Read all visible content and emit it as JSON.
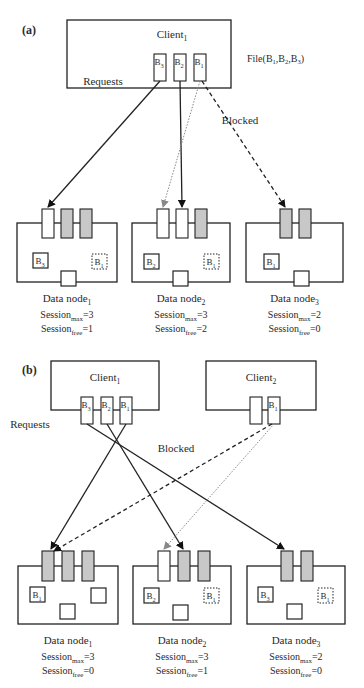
{
  "panels": [
    {
      "id": "a",
      "label": "(a)",
      "clients": [
        {
          "name": "Client",
          "sub": "1",
          "box": [
            67,
            20,
            164,
            68
          ],
          "name_pos": [
            172,
            38
          ],
          "slots": [
            {
              "x": 154,
              "label": "B",
              "sub": "3"
            },
            {
              "x": 174,
              "label": "B",
              "sub": "2"
            },
            {
              "x": 194,
              "label": "B",
              "sub": "1"
            }
          ],
          "slot_y": 54,
          "slot_w": 12,
          "slot_h": 27
        }
      ],
      "file_label": {
        "text": "File(B",
        "parts": [
          "1",
          ",B",
          "2",
          ",B",
          "3",
          ")"
        ],
        "pos": [
          247,
          62
        ]
      },
      "requests_label": {
        "text": "Requests",
        "pos": [
          103,
          85
        ]
      },
      "blocked_label": {
        "text": "Blocked",
        "pos": [
          240,
          124
        ]
      },
      "nodes": [
        {
          "name": "Data node",
          "sub": "1",
          "box": [
            17,
            223,
            100,
            59
          ],
          "slots": [
            {
              "x": 42,
              "fill": "#ffffff"
            },
            {
              "x": 61,
              "fill": "#c8c8c8"
            },
            {
              "x": 80,
              "fill": "#c8c8c8"
            }
          ],
          "slot_y": 209,
          "slot_w": 12,
          "slot_h": 29,
          "blocks": [
            {
              "x": 33,
              "y": 253,
              "label": "B",
              "sub": "3",
              "dotted": false
            },
            {
              "x": 92,
              "y": 254,
              "label": "B",
              "sub": "1",
              "dotted": true
            },
            {
              "x": 61,
              "y": 271,
              "label": "",
              "sub": "",
              "dotted": false
            }
          ],
          "session_max": "3",
          "session_free": "1"
        },
        {
          "name": "Data node",
          "sub": "2",
          "box": [
            132,
            223,
            98,
            59
          ],
          "slots": [
            {
              "x": 157,
              "fill": "#ffffff"
            },
            {
              "x": 176,
              "fill": "#ffffff"
            },
            {
              "x": 195,
              "fill": "#c8c8c8"
            }
          ],
          "slot_y": 209,
          "slot_w": 12,
          "slot_h": 29,
          "blocks": [
            {
              "x": 144,
              "y": 254,
              "label": "B",
              "sub": "2",
              "dotted": false
            },
            {
              "x": 204,
              "y": 254,
              "label": "B",
              "sub": "1",
              "dotted": true
            },
            {
              "x": 173,
              "y": 271,
              "label": "",
              "sub": "",
              "dotted": false
            }
          ],
          "session_max": "3",
          "session_free": "2"
        },
        {
          "name": "Data node",
          "sub": "3",
          "box": [
            246,
            223,
            97,
            59
          ],
          "slots": [
            {
              "x": 280,
              "fill": "#c8c8c8"
            },
            {
              "x": 299,
              "fill": "#c8c8c8"
            }
          ],
          "slot_y": 209,
          "slot_w": 12,
          "slot_h": 29,
          "blocks": [
            {
              "x": 264,
              "y": 254,
              "label": "B",
              "sub": "1",
              "dotted": false
            },
            {
              "x": 294,
              "y": 271,
              "label": "",
              "sub": "",
              "dotted": false
            }
          ],
          "session_max": "2",
          "session_free": "0"
        }
      ],
      "node_label_y": 302,
      "arrows": [
        {
          "from": [
            160,
            81
          ],
          "to": [
            48,
            207
          ],
          "style": "solid",
          "color": "#222222"
        },
        {
          "from": [
            180,
            81
          ],
          "to": [
            182,
            207
          ],
          "style": "solid",
          "color": "#222222"
        },
        {
          "from": [
            200,
            81
          ],
          "to": [
            163,
            207
          ],
          "style": "dotted",
          "color": "#888888"
        },
        {
          "from": [
            202,
            81
          ],
          "to": [
            285,
            207
          ],
          "style": "dashed",
          "color": "#222222"
        }
      ]
    },
    {
      "id": "b",
      "label": "(b)",
      "clients": [
        {
          "name": "Client",
          "sub": "1",
          "box": [
            51,
            361,
            108,
            49
          ],
          "name_pos": [
            105,
            381
          ],
          "slots": [
            {
              "x": 81,
              "label": "B",
              "sub": "3"
            },
            {
              "x": 101,
              "label": "B",
              "sub": "2"
            },
            {
              "x": 120,
              "label": "B",
              "sub": "1"
            }
          ],
          "slot_y": 397,
          "slot_w": 12,
          "slot_h": 27
        },
        {
          "name": "Client",
          "sub": "2",
          "box": [
            206,
            361,
            110,
            49
          ],
          "name_pos": [
            261,
            381
          ],
          "slots": [
            {
              "x": 250,
              "label": "",
              "sub": ""
            },
            {
              "x": 268,
              "label": "B",
              "sub": "1"
            }
          ],
          "slot_y": 397,
          "slot_w": 12,
          "slot_h": 27
        }
      ],
      "requests_label": {
        "text": "Requests",
        "pos": [
          30,
          428
        ]
      },
      "blocked_label": {
        "text": "Blocked",
        "pos": [
          176,
          452
        ]
      },
      "nodes": [
        {
          "name": "Data node",
          "sub": "1",
          "box": [
            18,
            566,
            100,
            58
          ],
          "slots": [
            {
              "x": 42,
              "fill": "#c8c8c8"
            },
            {
              "x": 62,
              "fill": "#c8c8c8"
            },
            {
              "x": 82,
              "fill": "#c8c8c8"
            }
          ],
          "slot_y": 551,
          "slot_w": 12,
          "slot_h": 30,
          "blocks": [
            {
              "x": 30,
              "y": 587,
              "label": "B",
              "sub": "1",
              "dotted": false
            },
            {
              "x": 91,
              "y": 588,
              "label": "",
              "sub": "",
              "dotted": false
            },
            {
              "x": 60,
              "y": 604,
              "label": "",
              "sub": "",
              "dotted": false
            }
          ],
          "session_max": "3",
          "session_free": "0"
        },
        {
          "name": "Data node",
          "sub": "2",
          "box": [
            133,
            566,
            98,
            58
          ],
          "slots": [
            {
              "x": 158,
              "fill": "#ffffff"
            },
            {
              "x": 178,
              "fill": "#c8c8c8"
            },
            {
              "x": 198,
              "fill": "#c8c8c8"
            }
          ],
          "slot_y": 551,
          "slot_w": 12,
          "slot_h": 30,
          "blocks": [
            {
              "x": 144,
              "y": 588,
              "label": "B",
              "sub": "2",
              "dotted": false
            },
            {
              "x": 204,
              "y": 588,
              "label": "B",
              "sub": "1",
              "dotted": true
            },
            {
              "x": 173,
              "y": 605,
              "label": "",
              "sub": "",
              "dotted": false
            }
          ],
          "session_max": "3",
          "session_free": "1"
        },
        {
          "name": "Data node",
          "sub": "3",
          "box": [
            247,
            566,
            98,
            58
          ],
          "slots": [
            {
              "x": 281,
              "fill": "#c8c8c8"
            },
            {
              "x": 301,
              "fill": "#c8c8c8"
            }
          ],
          "slot_y": 551,
          "slot_w": 12,
          "slot_h": 30,
          "blocks": [
            {
              "x": 258,
              "y": 587,
              "label": "B",
              "sub": "3",
              "dotted": false
            },
            {
              "x": 318,
              "y": 588,
              "label": "B",
              "sub": "1",
              "dotted": true
            },
            {
              "x": 287,
              "y": 604,
              "label": "",
              "sub": "",
              "dotted": false
            }
          ],
          "session_max": "2",
          "session_free": "0"
        }
      ],
      "node_label_y": 644,
      "arrows": [
        {
          "from": [
            126,
            424
          ],
          "to": [
            51,
            549
          ],
          "style": "solid",
          "color": "#222222"
        },
        {
          "from": [
            107,
            424
          ],
          "to": [
            183,
            549
          ],
          "style": "solid",
          "color": "#222222"
        },
        {
          "from": [
            87,
            424
          ],
          "to": [
            284,
            549
          ],
          "style": "solid",
          "color": "#222222"
        },
        {
          "from": [
            272,
            424
          ],
          "to": [
            54,
            551
          ],
          "style": "dashed",
          "color": "#222222"
        },
        {
          "from": [
            274,
            424
          ],
          "to": [
            164,
            549
          ],
          "style": "dotted",
          "color": "#888888"
        }
      ]
    }
  ],
  "session_label": "Session",
  "session_max_sub": "max",
  "session_free_sub": "free",
  "colors": {
    "line": "#222222",
    "occupied_slot": "#c8c8c8",
    "free_slot": "#ffffff",
    "secondary_arrow": "#888888"
  }
}
